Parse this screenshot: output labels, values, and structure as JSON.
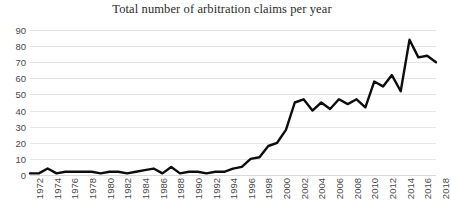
{
  "chart_data": {
    "type": "line",
    "title": "Total number of arbitration claims per year",
    "xlabel": "",
    "ylabel": "",
    "ylim": [
      0,
      90
    ],
    "ytick_step": 10,
    "yticks": [
      90,
      80,
      70,
      60,
      50,
      40,
      30,
      20,
      10,
      0
    ],
    "xlim": [
      1972,
      2018
    ],
    "xtick_step": 2,
    "xticks": [
      1972,
      1974,
      1976,
      1978,
      1980,
      1982,
      1984,
      1986,
      1988,
      1990,
      1992,
      1994,
      1996,
      1998,
      2000,
      2002,
      2004,
      2006,
      2008,
      2010,
      2012,
      2014,
      2016,
      2018
    ],
    "xtick_rotation": -90,
    "grid": true,
    "grid_axis": "y",
    "legend": false,
    "legend_position": "none",
    "line_color": "#0d0d0d",
    "grid_color": "#e6e6e6",
    "x": [
      1972,
      1973,
      1974,
      1975,
      1976,
      1977,
      1978,
      1979,
      1980,
      1981,
      1982,
      1983,
      1984,
      1985,
      1986,
      1987,
      1988,
      1989,
      1990,
      1991,
      1992,
      1993,
      1994,
      1995,
      1996,
      1997,
      1998,
      1999,
      2000,
      2001,
      2002,
      2003,
      2004,
      2005,
      2006,
      2007,
      2008,
      2009,
      2010,
      2011,
      2012,
      2013,
      2014,
      2015,
      2016,
      2017,
      2018
    ],
    "series": [
      {
        "name": "Arbitration claims",
        "values": [
          1,
          1,
          4,
          1,
          2,
          2,
          2,
          2,
          1,
          2,
          2,
          1,
          2,
          3,
          4,
          1,
          5,
          1,
          2,
          2,
          1,
          2,
          2,
          4,
          5,
          10,
          11,
          18,
          20,
          28,
          45,
          47,
          40,
          45,
          41,
          47,
          44,
          47,
          42,
          58,
          55,
          62,
          52,
          84,
          73,
          74,
          70
        ]
      }
    ]
  }
}
